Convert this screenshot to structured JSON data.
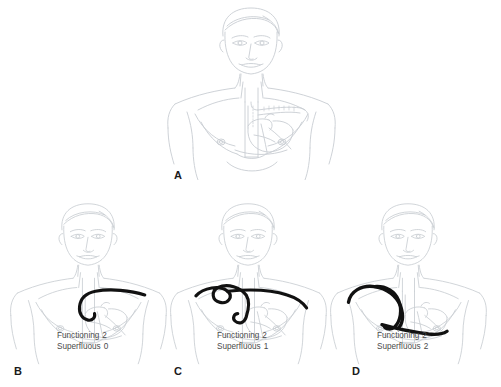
{
  "figure": {
    "type": "medical-illustration",
    "background_color": "#ffffff",
    "anatomy_line_color": "#c8cdd2",
    "lead_color": "#111111",
    "text_color": "#4a4a4a",
    "letter_color": "#1a1a1a"
  },
  "panels": [
    {
      "id": "A",
      "letter": "A",
      "has_lead": false,
      "stats": null
    },
    {
      "id": "B",
      "letter": "B",
      "has_lead": true,
      "stats": {
        "functioning_label": "Functioning",
        "functioning_value": "2",
        "superfluous_label": "Superfluous",
        "superfluous_value": "0"
      }
    },
    {
      "id": "C",
      "letter": "C",
      "has_lead": true,
      "stats": {
        "functioning_label": "Functioning",
        "functioning_value": "2",
        "superfluous_label": "Superfluous",
        "superfluous_value": "1"
      }
    },
    {
      "id": "D",
      "letter": "D",
      "has_lead": true,
      "stats": {
        "functioning_label": "Functioning",
        "functioning_value": "2",
        "superfluous_label": "Superfluous",
        "superfluous_value": "2"
      }
    }
  ]
}
